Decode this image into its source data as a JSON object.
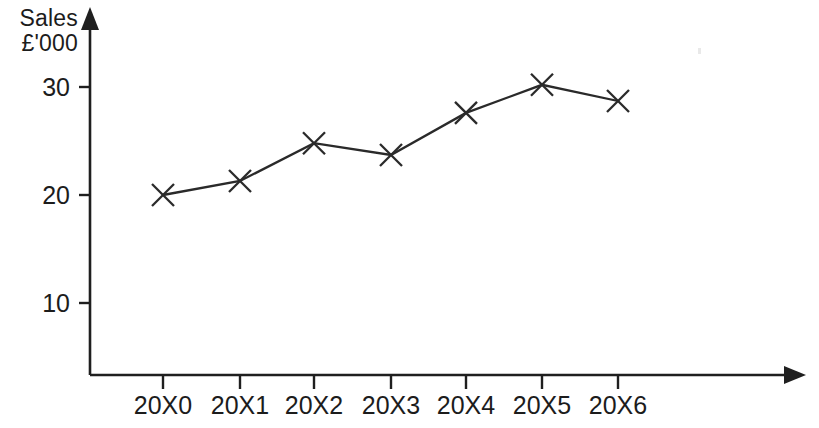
{
  "chart_data": {
    "type": "line",
    "title": "",
    "subtitle": "",
    "ylabel_line1": "Sales",
    "ylabel_line2": "£'000",
    "xlabel": "",
    "categories": [
      "20X0",
      "20X1",
      "20X2",
      "20X3",
      "20X4",
      "20X5",
      "20X6"
    ],
    "values": [
      20.0,
      21.3,
      24.8,
      23.7,
      27.6,
      30.2,
      28.7
    ],
    "series": [
      {
        "name": "Sales",
        "values": [
          20.0,
          21.3,
          24.8,
          23.7,
          27.6,
          30.2,
          28.7
        ]
      }
    ],
    "ytick_labels": [
      "10",
      "20",
      "30"
    ],
    "ytick_values": [
      10,
      20,
      30
    ],
    "ylim": [
      0,
      34
    ],
    "xlim": [
      -0.85,
      2.6
    ],
    "grid": false,
    "legend": false,
    "legend_position": "none",
    "marker": "x",
    "line_color": "#2a2a2a",
    "axis_color": "#1f1f1f",
    "background_color": "#ffffff",
    "axis_arrows": {
      "y_axis_arrow": "up-arrow-icon",
      "x_axis_arrow": "right-arrow-icon"
    }
  },
  "geometry": {
    "y_axis_x": 90,
    "x_axis_y": 375,
    "y_axis_top": 8,
    "x_axis_right": 805,
    "point_x": [
      163,
      240,
      314,
      391,
      466,
      542,
      618
    ],
    "point_y": [
      196,
      181,
      143,
      155,
      113,
      85,
      101
    ],
    "ytick_y": [
      303,
      195,
      87
    ],
    "tick_len": 11,
    "marker_radius": 11
  }
}
